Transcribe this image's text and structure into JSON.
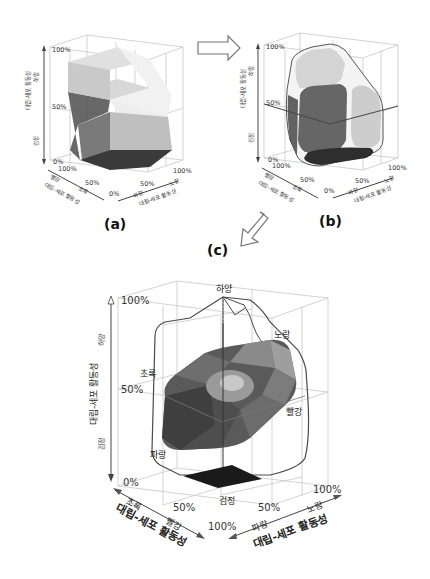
{
  "figure": {
    "panels": [
      {
        "id": "a",
        "label": "(a)",
        "vertical_axis": {
          "title": "대립-세포 활동성",
          "top_end": "하양",
          "bottom_end": "검정",
          "ticks": [
            "100%",
            "50%",
            "0%"
          ]
        },
        "left_axis": {
          "title": "대립-세포 활동성",
          "end_a": "빨강",
          "end_b": "초록",
          "ticks": [
            "100%",
            "50%",
            "0%"
          ]
        },
        "right_axis": {
          "title": "대립-세포 활동성",
          "end_a": "파랑",
          "end_b": "노랑",
          "ticks": [
            "50%",
            "100%"
          ]
        },
        "description": "Piecewise-flat color solid with sharp edges"
      },
      {
        "id": "b",
        "label": "(b)",
        "vertical_axis": {
          "title": "대립-세포 활동성",
          "top_end": "하양",
          "bottom_end": "검정",
          "ticks": [
            "100%",
            "50%",
            "0%"
          ]
        },
        "left_axis": {
          "title": "대립-세포 활동성",
          "end_a": "빨강",
          "end_b": "초록",
          "ticks": [
            "100%",
            "50%",
            "0%"
          ]
        },
        "right_axis": {
          "title": "대립-세포 활동성",
          "end_a": "파랑",
          "end_b": "노랑",
          "ticks": [
            "50%",
            "100%"
          ]
        },
        "description": "Rounded color solid with smoothed edges"
      },
      {
        "id": "c",
        "label": "(c)",
        "vertical_axis": {
          "title": "대립-세포 활동성",
          "top_end": "하양",
          "bottom_end": "검정",
          "ticks": [
            "100%",
            "50%",
            "0%"
          ]
        },
        "left_axis": {
          "title": "대립-세포 활동성",
          "end_a": "초록",
          "end_b": "빨강",
          "ticks": [
            "50%",
            "100%"
          ]
        },
        "right_axis": {
          "title": "대립-세포 활동성",
          "end_a": "파랑",
          "end_b": "노랑",
          "ticks": [
            "50%",
            "100%"
          ]
        },
        "point_labels": {
          "white": "하양",
          "yellow": "노랑",
          "green": "초록",
          "red": "빨강",
          "blue": "파랑",
          "black": "검정"
        },
        "description": "Color solid with horizontal hue slice at mid lightness"
      }
    ],
    "arrows": [
      {
        "from": "a",
        "to": "b",
        "direction": "right"
      },
      {
        "from": "b",
        "to": "c",
        "direction": "down-left"
      }
    ]
  }
}
